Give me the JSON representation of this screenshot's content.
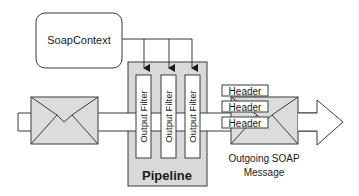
{
  "diagram": {
    "context_box": {
      "label": "SoapContext"
    },
    "pipeline": {
      "label": "Pipeline",
      "filters": [
        {
          "label": "Output Filter"
        },
        {
          "label": "Output Filter"
        },
        {
          "label": "Output Filter"
        }
      ]
    },
    "headers": [
      {
        "label": "Header"
      },
      {
        "label": "Header"
      },
      {
        "label": "Header"
      }
    ],
    "outgoing_message": {
      "line1": "Outgoing SOAP",
      "line2": "Message"
    },
    "colors": {
      "stroke": "#3a3a3a",
      "pipeline_fill": "#d9d9d9",
      "envelope_fill": "#dcdcdc",
      "box_fill": "#ffffff"
    }
  }
}
